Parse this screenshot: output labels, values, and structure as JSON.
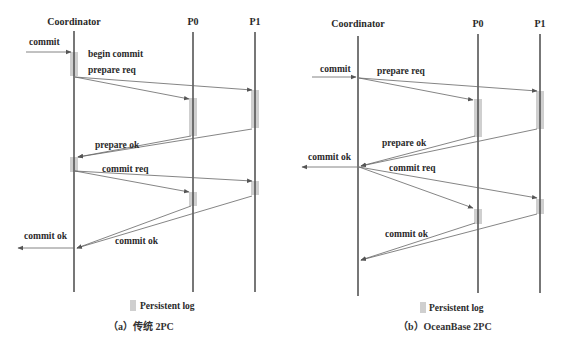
{
  "colors": {
    "lifeline": "#555555",
    "arrow": "#666666",
    "persistent_log": "#cfcfcf",
    "text": "#2a2a2a",
    "background": "#ffffff"
  },
  "panels": [
    {
      "id": "a",
      "caption": "（a）传统 2PC",
      "legend": "Persistent log",
      "participants": [
        {
          "name": "Coordinator",
          "x": 74
        },
        {
          "name": "P0",
          "x": 193
        },
        {
          "name": "P1",
          "x": 255
        }
      ],
      "messages": [
        {
          "label": "commit",
          "from": "client",
          "to": "Coordinator"
        },
        {
          "label": "begin commit",
          "type": "note"
        },
        {
          "label": "prepare req",
          "from": "Coordinator",
          "to": [
            "P0",
            "P1"
          ]
        },
        {
          "label": "prepare ok",
          "from": [
            "P0",
            "P1"
          ],
          "to": "Coordinator"
        },
        {
          "label": "commit req",
          "from": "Coordinator",
          "to": [
            "P0",
            "P1"
          ]
        },
        {
          "label": "commit ok",
          "from": [
            "P0",
            "P1"
          ],
          "to": "Coordinator"
        },
        {
          "label": "commit ok",
          "from": "Coordinator",
          "to": "client"
        }
      ]
    },
    {
      "id": "b",
      "caption": "（b）OceanBase 2PC",
      "legend": "Persistent log",
      "participants": [
        {
          "name": "Coordinator",
          "x": 358
        },
        {
          "name": "P0",
          "x": 478
        },
        {
          "name": "P1",
          "x": 540
        }
      ],
      "messages": [
        {
          "label": "commit",
          "from": "client",
          "to": "Coordinator"
        },
        {
          "label": "prepare req",
          "from": "Coordinator",
          "to": [
            "P0",
            "P1"
          ]
        },
        {
          "label": "prepare ok",
          "from": [
            "P0",
            "P1"
          ],
          "to": "Coordinator"
        },
        {
          "label": "commit ok",
          "from": "Coordinator",
          "to": "client"
        },
        {
          "label": "commit req",
          "from": "Coordinator",
          "to": [
            "P0",
            "P1"
          ]
        },
        {
          "label": "commit ok",
          "from": [
            "P0",
            "P1"
          ],
          "to": "Coordinator"
        }
      ]
    }
  ]
}
